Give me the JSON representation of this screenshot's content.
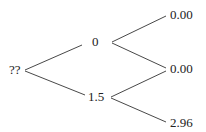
{
  "tree": {
    "root": {
      "label": "??"
    },
    "level1": [
      {
        "label": "0"
      },
      {
        "label": "1.5"
      }
    ],
    "level2": [
      {
        "label": "0.00"
      },
      {
        "label": "0.00"
      },
      {
        "label": "2.96"
      }
    ]
  },
  "colors": {
    "line": "#333333",
    "text": "#222222",
    "background": "#ffffff"
  }
}
